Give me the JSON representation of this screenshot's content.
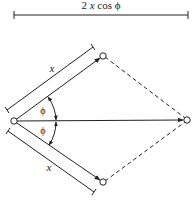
{
  "diagram": {
    "dimension_label": "2 x cos ϕ",
    "dimension_label_parts": {
      "coef": "2",
      "var": "x",
      "func": "cos",
      "angle": "ϕ"
    },
    "upper_length_label": "x",
    "lower_length_label": "x",
    "upper_angle_label": "ϕ",
    "lower_angle_label": "ϕ",
    "colors": {
      "line": "#222222",
      "background": "#ffffff"
    },
    "nodes": {
      "origin": [
        14,
        121
      ],
      "upper_tip": [
        103,
        56
      ],
      "lower_tip": [
        103,
        182
      ],
      "resultant_tip": [
        187,
        120
      ]
    }
  }
}
